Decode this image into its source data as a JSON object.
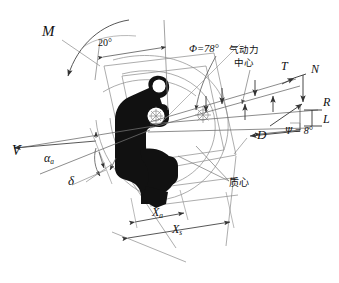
{
  "figure": {
    "type": "technical-engineering-diagram",
    "background_color": "#ffffff",
    "line_color": "#6b6b6b",
    "silhouette_color": "#111111",
    "text_color": "#111111"
  },
  "labels": {
    "moment": "M",
    "angle_20": "20°",
    "phi": "Φ=78°",
    "aero_center_line1": "气动力",
    "aero_center_line2": "中心",
    "thrust": "T",
    "normal_force": "N",
    "resultant": "R",
    "lift": "L",
    "psi": "Ψ = 8°",
    "drag": "D",
    "center_of_mass": "质心",
    "velocity": "V",
    "alpha_a_base": "α",
    "alpha_a_sub": "a",
    "delta": "δ",
    "x_a_base": "X",
    "x_a_sub": "a",
    "x_s_base": "X",
    "x_s_sub": "s"
  },
  "values": {
    "phi_deg": 78,
    "psi_deg": 8,
    "seat_back_angle_deg": 20
  }
}
